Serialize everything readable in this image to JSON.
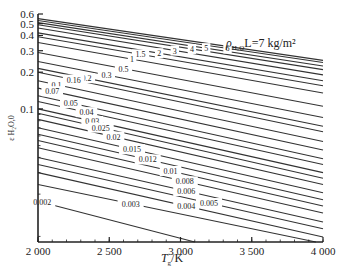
{
  "chart_data": {
    "type": "line",
    "annotation": "ρ H2O L=7 kg/m²",
    "xlabel": "Tg/K",
    "ylabel": "ε H2O,0",
    "xlim": [
      2000,
      4000
    ],
    "ylim": [
      0.0081,
      0.6
    ],
    "yscale": "log",
    "grid": false,
    "x_ticks": [
      2000,
      2500,
      3000,
      3500,
      4000
    ],
    "x_tick_labels": [
      "2 000",
      "2 500",
      "3 000",
      "3 500",
      "4 000"
    ],
    "y_ticks": [
      0.1,
      0.2,
      0.3,
      0.4,
      0.5,
      0.6
    ],
    "y_tick_labels": [
      "0.1",
      "0.2",
      "0.3",
      "0.4",
      "0.5",
      "0.6"
    ],
    "series_description": "Contour lines of constant ρH2O·L (kg/m²); emissivity decreases with gas temperature",
    "contour_levels": [
      "0.002",
      "0.003",
      "0.004",
      "0.005",
      "0.006",
      "0.008",
      "0.01",
      "0.012",
      "0.015",
      "0.02",
      "0.025",
      "0.03",
      "0.04",
      "0.05",
      "0.07",
      "0.1",
      "0.16",
      "0.2",
      "0.3",
      "0.5",
      "1",
      "1.5",
      "2",
      "3",
      "4",
      "5",
      "6",
      "7"
    ],
    "series": [
      {
        "name": "7",
        "x": [
          2000,
          4000
        ],
        "y": [
          0.55,
          0.25
        ]
      },
      {
        "name": "6",
        "x": [
          2000,
          4000
        ],
        "y": [
          0.53,
          0.24
        ]
      },
      {
        "name": "5",
        "x": [
          2000,
          4000
        ],
        "y": [
          0.51,
          0.225
        ]
      },
      {
        "name": "4",
        "x": [
          2000,
          4000
        ],
        "y": [
          0.49,
          0.21
        ]
      },
      {
        "name": "3",
        "x": [
          2000,
          4000
        ],
        "y": [
          0.46,
          0.19
        ]
      },
      {
        "name": "2",
        "x": [
          2000,
          4000
        ],
        "y": [
          0.42,
          0.17
        ]
      },
      {
        "name": "1.5",
        "x": [
          2000,
          4000
        ],
        "y": [
          0.39,
          0.155
        ]
      },
      {
        "name": "1",
        "x": [
          2000,
          4000
        ],
        "y": [
          0.35,
          0.135
        ]
      },
      {
        "name": "0.5",
        "x": [
          2000,
          4000
        ],
        "y": [
          0.29,
          0.105
        ]
      },
      {
        "name": "0.3",
        "x": [
          2000,
          4000
        ],
        "y": [
          0.245,
          0.085
        ]
      },
      {
        "name": "0.2",
        "x": [
          2000,
          4000
        ],
        "y": [
          0.215,
          0.072
        ]
      },
      {
        "name": "0.16",
        "x": [
          2000,
          4000
        ],
        "y": [
          0.2,
          0.065
        ]
      },
      {
        "name": "0.1",
        "x": [
          2000,
          4000
        ],
        "y": [
          0.17,
          0.054
        ]
      },
      {
        "name": "0.07",
        "x": [
          2000,
          4000
        ],
        "y": [
          0.148,
          0.046
        ]
      },
      {
        "name": "0.05",
        "x": [
          2000,
          4000
        ],
        "y": [
          0.128,
          0.039
        ]
      },
      {
        "name": "0.04",
        "x": [
          2000,
          4000
        ],
        "y": [
          0.115,
          0.035
        ]
      },
      {
        "name": "0.03",
        "x": [
          2000,
          4000
        ],
        "y": [
          0.1,
          0.03
        ]
      },
      {
        "name": "0.025",
        "x": [
          2000,
          4000
        ],
        "y": [
          0.092,
          0.027
        ]
      },
      {
        "name": "0.02",
        "x": [
          2000,
          4000
        ],
        "y": [
          0.082,
          0.024
        ]
      },
      {
        "name": "0.015",
        "x": [
          2000,
          4000
        ],
        "y": [
          0.07,
          0.0205
        ]
      },
      {
        "name": "0.012",
        "x": [
          2000,
          4000
        ],
        "y": [
          0.062,
          0.018
        ]
      },
      {
        "name": "0.01",
        "x": [
          2000,
          4000
        ],
        "y": [
          0.055,
          0.016
        ]
      },
      {
        "name": "0.008",
        "x": [
          2000,
          4000
        ],
        "y": [
          0.048,
          0.014
        ]
      },
      {
        "name": "0.006",
        "x": [
          2000,
          4000
        ],
        "y": [
          0.04,
          0.0118
        ]
      },
      {
        "name": "0.005",
        "x": [
          2000,
          4000
        ],
        "y": [
          0.035,
          0.0104
        ]
      },
      {
        "name": "0.004",
        "x": [
          2000,
          4000
        ],
        "y": [
          0.03,
          0.0089
        ]
      },
      {
        "name": "0.003",
        "x": [
          2000,
          3950
        ],
        "y": [
          0.024,
          0.0081
        ]
      },
      {
        "name": "0.002",
        "x": [
          2000,
          3100
        ],
        "y": [
          0.0175,
          0.0081
        ]
      }
    ]
  },
  "labels": {
    "annotation_main": "ρ",
    "annotation_sub": "H₂O",
    "annotation_rest": "L=7 kg/m²",
    "xlabel_main": "T",
    "xlabel_sub": "g",
    "xlabel_rest": "/K",
    "ylabel": "ε H₂O,0"
  }
}
